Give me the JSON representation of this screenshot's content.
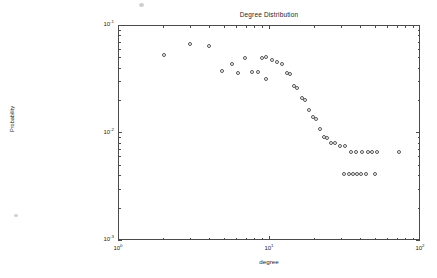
{
  "chart": {
    "title": "Degree Distribution",
    "xlabel": "degree",
    "ylabel": "Probability"
  },
  "axes": {
    "y_ticks": [
      {
        "label_mantissa": "10",
        "label_exponent": "-1",
        "value": 0.1,
        "top": 25
      },
      {
        "label_mantissa": "10",
        "label_exponent": "-2",
        "value": 0.01,
        "top": 132.5
      },
      {
        "label_mantissa": "10",
        "label_exponent": "-3",
        "value": 0.001,
        "top": 240
      }
    ],
    "x_ticks": [
      {
        "label_mantissa": "10",
        "label_exponent": "0",
        "value": 1,
        "left": 118
      },
      {
        "label_mantissa": "10",
        "label_exponent": "1",
        "value": 10,
        "left": 269
      },
      {
        "label_mantissa": "10",
        "label_exponent": "2",
        "value": 100,
        "left": 420
      }
    ]
  },
  "chart_data": {
    "type": "scatter",
    "title": "Degree Distribution",
    "xlabel": "degree",
    "ylabel": "Probability",
    "xscale": "log",
    "yscale": "log",
    "xlim": [
      1,
      100
    ],
    "ylim": [
      0.001,
      0.1
    ],
    "grid": false,
    "legend": null,
    "marker": "open-circle",
    "marker_color": "#555555",
    "series": [
      {
        "name": "Degree distribution",
        "x": [
          2,
          3,
          4,
          5,
          6,
          6.5,
          7,
          8,
          9,
          10,
          11,
          12,
          13,
          14,
          15,
          16,
          17,
          18,
          19,
          20,
          21,
          22,
          23,
          24,
          25,
          26,
          27,
          28,
          30,
          32,
          34,
          36,
          38,
          40,
          42,
          45,
          48,
          52,
          56,
          60,
          62,
          65,
          68,
          72,
          80
        ],
        "y": [
          0.062,
          0.081,
          0.076,
          0.035,
          0.044,
          0.032,
          0.056,
          0.034,
          0.033,
          0.056,
          0.059,
          0.052,
          0.046,
          0.044,
          0.031,
          0.03,
          0.02,
          0.019,
          0.013,
          0.0125,
          0.0088,
          0.0072,
          0.0069,
          0.005,
          0.0038,
          0.0036,
          0.003,
          0.003,
          0.0028,
          0.0028,
          0.0028,
          0.0021,
          0.0021,
          0.0021,
          0.0021,
          0.0021,
          0.0021,
          0.0017,
          0.0017,
          0.0017,
          0.0017,
          0.0017,
          0.0017,
          0.0017,
          0.0021
        ]
      }
    ]
  },
  "markers": [
    {
      "x": 164,
      "y": 55
    },
    {
      "x": 190,
      "y": 44
    },
    {
      "x": 209,
      "y": 46
    },
    {
      "x": 222,
      "y": 71
    },
    {
      "x": 232,
      "y": 64
    },
    {
      "x": 238,
      "y": 73
    },
    {
      "x": 245,
      "y": 58
    },
    {
      "x": 252,
      "y": 72
    },
    {
      "x": 258,
      "y": 72
    },
    {
      "x": 262,
      "y": 58
    },
    {
      "x": 266,
      "y": 57
    },
    {
      "x": 272,
      "y": 60
    },
    {
      "x": 277,
      "y": 62
    },
    {
      "x": 282,
      "y": 64
    },
    {
      "x": 287,
      "y": 73
    },
    {
      "x": 290,
      "y": 74
    },
    {
      "x": 294,
      "y": 86
    },
    {
      "x": 297,
      "y": 88
    },
    {
      "x": 302,
      "y": 98
    },
    {
      "x": 305,
      "y": 100
    },
    {
      "x": 309,
      "y": 110
    },
    {
      "x": 313,
      "y": 117
    },
    {
      "x": 316,
      "y": 119
    },
    {
      "x": 320,
      "y": 129
    },
    {
      "x": 324,
      "y": 137
    },
    {
      "x": 327,
      "y": 138
    },
    {
      "x": 331,
      "y": 143
    },
    {
      "x": 335,
      "y": 143
    },
    {
      "x": 340,
      "y": 146
    },
    {
      "x": 345,
      "y": 146
    },
    {
      "x": 351,
      "y": 152
    },
    {
      "x": 356,
      "y": 152
    },
    {
      "x": 362,
      "y": 152
    },
    {
      "x": 368,
      "y": 152
    },
    {
      "x": 372,
      "y": 152
    },
    {
      "x": 377,
      "y": 152
    },
    {
      "x": 399,
      "y": 152
    },
    {
      "x": 344,
      "y": 174
    },
    {
      "x": 349,
      "y": 174
    },
    {
      "x": 353,
      "y": 174
    },
    {
      "x": 357,
      "y": 174
    },
    {
      "x": 361,
      "y": 174
    },
    {
      "x": 366,
      "y": 174
    },
    {
      "x": 375,
      "y": 174
    },
    {
      "x": 266,
      "y": 79
    }
  ],
  "artifacts": [
    {
      "x": 14,
      "y": 214,
      "w": 4,
      "h": 3
    },
    {
      "x": 139,
      "y": 3,
      "w": 5,
      "h": 4
    }
  ]
}
